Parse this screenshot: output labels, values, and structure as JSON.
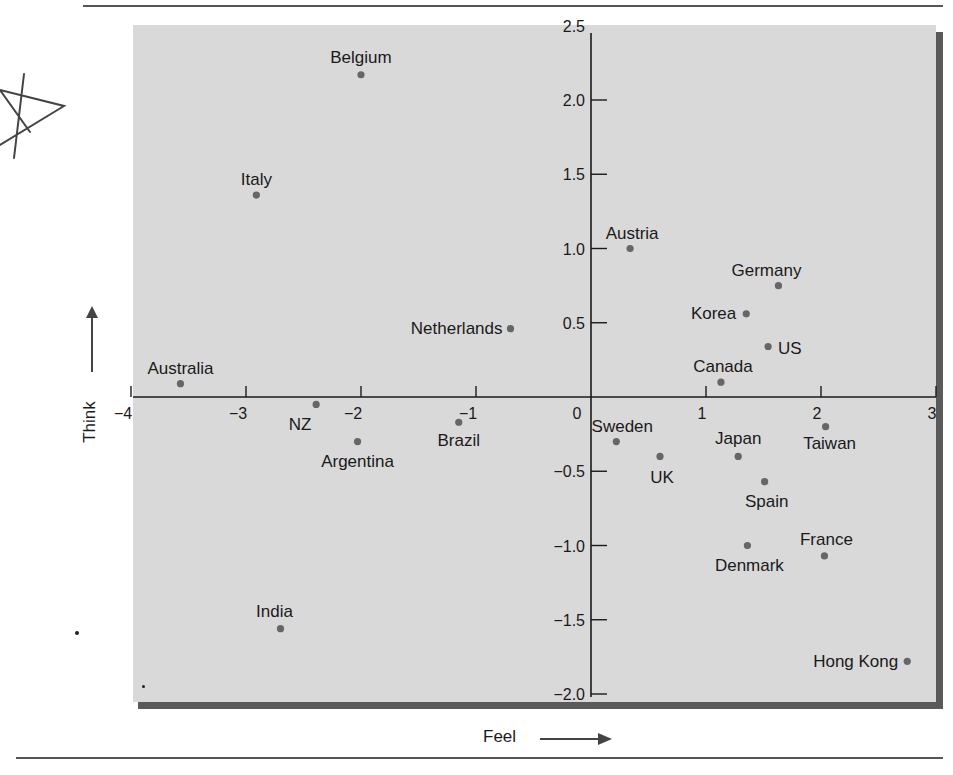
{
  "chart_data": {
    "type": "scatter",
    "title": "",
    "xlabel": "Feel",
    "ylabel": "Think",
    "xlim": [
      -4.2,
      3.1
    ],
    "ylim": [
      -2.05,
      2.6
    ],
    "x_ticks": [
      -4,
      -3,
      -2,
      -1,
      0,
      1,
      2,
      3
    ],
    "x_tick_labels": [
      "−4",
      "−3",
      "−2",
      "−1",
      "0",
      "1",
      "2",
      "3"
    ],
    "y_ticks": [
      -2.0,
      -1.5,
      -1.0,
      -0.5,
      0.5,
      1.0,
      1.5,
      2.0,
      2.5
    ],
    "y_tick_labels": [
      "−2.0",
      "−1.5",
      "−1.0",
      "−0.5",
      "0.5",
      "1.0",
      "1.5",
      "2.0",
      "2.5"
    ],
    "grid": false,
    "axes_through_origin": true,
    "points": [
      {
        "label": "Belgium",
        "x": -2.0,
        "y": 2.17
      },
      {
        "label": "Italy",
        "x": -2.91,
        "y": 1.36
      },
      {
        "label": "Austria",
        "x": 0.34,
        "y": 1.0
      },
      {
        "label": "Germany",
        "x": 1.63,
        "y": 0.75
      },
      {
        "label": "Korea",
        "x": 1.35,
        "y": 0.56
      },
      {
        "label": "Netherlands",
        "x": -0.7,
        "y": 0.46
      },
      {
        "label": "US",
        "x": 1.54,
        "y": 0.34
      },
      {
        "label": "Canada",
        "x": 1.13,
        "y": 0.1
      },
      {
        "label": "Australia",
        "x": -3.57,
        "y": 0.09
      },
      {
        "label": "NZ",
        "x": -2.39,
        "y": -0.05
      },
      {
        "label": "Brazil",
        "x": -1.15,
        "y": -0.17
      },
      {
        "label": "Taiwan",
        "x": 2.04,
        "y": -0.2
      },
      {
        "label": "Argentina",
        "x": -2.03,
        "y": -0.3
      },
      {
        "label": "Sweden",
        "x": 0.22,
        "y": -0.3
      },
      {
        "label": "UK",
        "x": 0.6,
        "y": -0.4
      },
      {
        "label": "Japan",
        "x": 1.28,
        "y": -0.4
      },
      {
        "label": "Spain",
        "x": 1.51,
        "y": -0.57
      },
      {
        "label": "Denmark",
        "x": 1.36,
        "y": -1.0
      },
      {
        "label": "France",
        "x": 2.03,
        "y": -1.07
      },
      {
        "label": "India",
        "x": -2.7,
        "y": -1.56
      },
      {
        "label": "Hong Kong",
        "x": 2.75,
        "y": -1.78
      }
    ]
  },
  "labels": {
    "xlabel": "Feel",
    "ylabel": "Think"
  },
  "colors": {
    "plot_bg": "#d9d9d9",
    "point": "#666666",
    "axis": "#1a1a1a",
    "shadow": "#5a5a5a"
  }
}
